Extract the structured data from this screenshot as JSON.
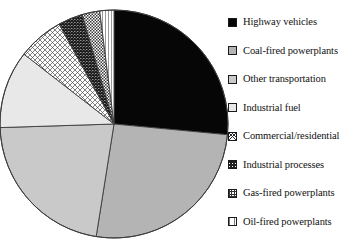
{
  "chart_data": {
    "type": "pie",
    "title": "",
    "subtitle": "",
    "xlabel": "",
    "ylabel": "",
    "legend_position": "right",
    "grid": false,
    "start_angle_deg": 0,
    "direction": "clockwise",
    "categories": [
      "Highway vehicles",
      "Coal-fired powerplants",
      "Other transportation",
      "Industrial fuel",
      "Commercial/residential",
      "Industrial processes",
      "Gas-fired powerplants",
      "Oil-fired powerplants"
    ],
    "values": [
      26.5,
      26.0,
      22.0,
      11.0,
      6.5,
      3.5,
      2.5,
      2.0
    ],
    "units": "percent",
    "slices": [
      {
        "label": "Highway vehicles",
        "value": 26.5,
        "start_deg": 0,
        "end_deg": 95.4,
        "fill": "solid-black",
        "color": "#060606",
        "swatch": "sw-solid-black"
      },
      {
        "label": "Coal-fired powerplants",
        "value": 26.0,
        "start_deg": 95.4,
        "end_deg": 189.0,
        "fill": "solid-gray-medium",
        "color": "#b4b4b4",
        "swatch": "sw-gray-med"
      },
      {
        "label": "Other transportation",
        "value": 22.0,
        "start_deg": 189.0,
        "end_deg": 268.2,
        "fill": "solid-gray-light",
        "color": "#c9c9c9",
        "swatch": "sw-gray-light"
      },
      {
        "label": "Industrial fuel",
        "value": 11.0,
        "start_deg": 268.2,
        "end_deg": 307.8,
        "fill": "solid-gray-very-light",
        "color": "#e8e8e8",
        "swatch": "sw-gray-vlight"
      },
      {
        "label": "Commercial/residential",
        "value": 6.5,
        "start_deg": 307.8,
        "end_deg": 331.2,
        "fill": "cross-hatch",
        "color": "#bfbfbf",
        "swatch": "sw-crosshatch"
      },
      {
        "label": "Industrial processes",
        "value": 3.5,
        "start_deg": 331.2,
        "end_deg": 343.8,
        "fill": "dense-diagonal-hatch",
        "color": "#3a3a3a",
        "swatch": "sw-dense-hatch"
      },
      {
        "label": "Gas-fired powerplants",
        "value": 2.5,
        "start_deg": 343.8,
        "end_deg": 352.8,
        "fill": "checkerboard",
        "color": "#8a8a8a",
        "swatch": "sw-checker"
      },
      {
        "label": "Oil-fired powerplants",
        "value": 2.0,
        "start_deg": 352.8,
        "end_deg": 360.0,
        "fill": "light-vertical-lines",
        "color": "#d0d0d0",
        "swatch": "sw-vlines"
      }
    ]
  },
  "legend": {
    "items": [
      {
        "label": "Highway vehicles",
        "swatch": "sw-solid-black"
      },
      {
        "label": "Coal-fired powerplants",
        "swatch": "sw-gray-med"
      },
      {
        "label": "Other transportation",
        "swatch": "sw-gray-light"
      },
      {
        "label": "Industrial fuel",
        "swatch": "sw-gray-vlight"
      },
      {
        "label": "Commercial/residential",
        "swatch": "sw-crosshatch"
      },
      {
        "label": "Industrial processes",
        "swatch": "sw-dense-hatch"
      },
      {
        "label": "Gas-fired powerplants",
        "swatch": "sw-checker"
      },
      {
        "label": "Oil-fired powerplants",
        "swatch": "sw-vlines"
      }
    ]
  },
  "pie_geometry": {
    "center_x": 114,
    "center_y": 124,
    "radius": 114,
    "outline_color": "#3c3c3c"
  }
}
